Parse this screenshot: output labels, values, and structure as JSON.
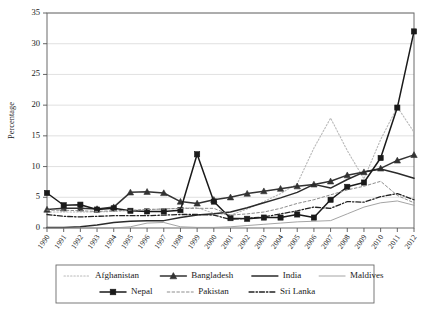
{
  "chart_data": {
    "type": "line",
    "title": "",
    "xlabel": "",
    "ylabel": "Percentage",
    "ylim": [
      0,
      35
    ],
    "ytick_step": 5,
    "yticks": [
      "0",
      "5",
      "10",
      "15",
      "20",
      "25",
      "30",
      "35"
    ],
    "grid": true,
    "legend_position": "bottom",
    "x": [
      "1990",
      "1991",
      "1992",
      "1993",
      "1994",
      "1995",
      "1996",
      "1997",
      "1998",
      "1999",
      "2000",
      "2001",
      "2002",
      "2003",
      "2004",
      "2005",
      "2006",
      "2007",
      "2008",
      "2009",
      "2010",
      "2011",
      "2012"
    ],
    "series": [
      {
        "name": "Afghanistan",
        "style": "dotted",
        "color": "#b9b9b9",
        "marker": "none",
        "values": [
          2.6,
          2.6,
          2.6,
          2.6,
          2.7,
          2.8,
          3.0,
          3.1,
          3.2,
          3.3,
          2.4,
          2.1,
          3.1,
          4.3,
          5.6,
          7.2,
          13.0,
          17.9,
          12.6,
          8.0,
          14.4,
          19.7,
          15.6
        ]
      },
      {
        "name": "Bangladesh",
        "style": "solid",
        "color": "#333333",
        "marker": "triangle",
        "values": [
          3.0,
          3.2,
          3.2,
          3.1,
          3.4,
          5.8,
          5.9,
          5.7,
          4.3,
          4.0,
          4.6,
          5.0,
          5.6,
          6.0,
          6.4,
          6.8,
          7.1,
          7.6,
          8.6,
          9.1,
          9.7,
          11.0,
          11.9
        ]
      },
      {
        "name": "India",
        "style": "solid",
        "color": "#2b2b2b",
        "marker": "none",
        "values": [
          0.1,
          0.1,
          0.2,
          0.5,
          0.9,
          1.1,
          1.2,
          1.2,
          1.7,
          2.1,
          2.3,
          2.6,
          3.3,
          4.1,
          4.9,
          5.8,
          7.1,
          6.5,
          7.9,
          9.1,
          9.6,
          8.9,
          8.1
        ]
      },
      {
        "name": "Maldives",
        "style": "solid-thin",
        "color": "#9a9a9a",
        "marker": "none",
        "values": [
          0.0,
          0.0,
          0.0,
          0.0,
          0.0,
          0.2,
          0.8,
          0.9,
          0.2,
          0.1,
          0.1,
          0.2,
          0.4,
          0.6,
          0.8,
          1.0,
          1.1,
          1.2,
          2.3,
          3.4,
          4.1,
          4.4,
          3.7
        ]
      },
      {
        "name": "Nepal",
        "style": "solid",
        "color": "#1a1a1a",
        "marker": "square",
        "values": [
          5.7,
          3.7,
          3.8,
          3.0,
          3.2,
          2.8,
          2.7,
          2.7,
          2.9,
          12.0,
          4.3,
          1.6,
          1.5,
          1.7,
          1.7,
          2.2,
          1.7,
          4.6,
          6.7,
          7.4,
          11.4,
          19.6,
          32.0
        ]
      },
      {
        "name": "Pakistan",
        "style": "dashed",
        "color": "#8d8d8d",
        "marker": "none",
        "values": [
          2.9,
          2.9,
          2.8,
          2.7,
          2.8,
          2.9,
          3.0,
          3.1,
          3.2,
          3.2,
          3.2,
          2.1,
          2.3,
          2.6,
          3.2,
          4.0,
          4.6,
          5.4,
          6.2,
          6.8,
          7.6,
          5.3,
          4.1
        ]
      },
      {
        "name": "Sri Lanka",
        "style": "dashdot",
        "color": "#222222",
        "marker": "none",
        "values": [
          2.2,
          1.9,
          1.8,
          1.9,
          2.0,
          2.0,
          2.0,
          2.1,
          2.2,
          2.2,
          2.1,
          1.4,
          1.6,
          1.8,
          2.3,
          2.8,
          3.4,
          3.2,
          4.3,
          4.2,
          5.1,
          5.6,
          4.6
        ]
      }
    ]
  },
  "legend": {
    "row1": [
      "Afghanistan",
      "Bangladesh",
      "India",
      "Maldives"
    ],
    "row2": [
      "Nepal",
      "Pakistan",
      "Sri Lanka"
    ]
  }
}
